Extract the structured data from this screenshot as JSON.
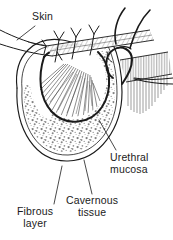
{
  "figure": {
    "kind": "medical-illustration",
    "background_color": "#ffffff",
    "ink_color": "#1a1a1a",
    "stipple_color": "#8a8a8a",
    "hatch_color": "#4d4d4d",
    "width": 173,
    "height": 240
  },
  "labels": {
    "skin": "Skin",
    "urethral_mucosa": "Urethral\nmucosa",
    "cavernous_tissue": "Cavernous\ntissue",
    "fibrous_layer": "Fibrous\nlayer"
  },
  "annotations": [
    {
      "id": "skin",
      "text": "Skin",
      "leader": "down-left to skin edge"
    },
    {
      "id": "urethral-mucosa",
      "text": "Urethral mucosa",
      "leader": "up-left to inner mucosal edge"
    },
    {
      "id": "cavernous-tissue",
      "text": "Cavernous tissue",
      "leader": "up to stippled corpus region"
    },
    {
      "id": "fibrous-layer",
      "text": "Fibrous layer",
      "leader": "up-right to outer double-line border"
    }
  ]
}
